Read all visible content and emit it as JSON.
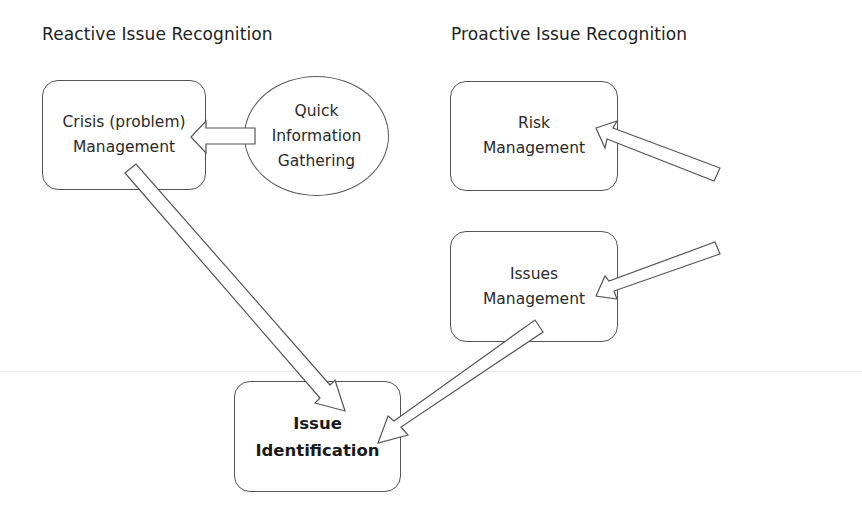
{
  "headings": {
    "reactive": "Reactive Issue Recognition",
    "proactive": "Proactive Issue Recognition"
  },
  "nodes": {
    "crisis": {
      "line1": "Crisis (problem)",
      "line2": "Management",
      "shape": "rounded-rect"
    },
    "quick": {
      "line1": "Quick",
      "line2": "Information",
      "line3": "Gathering",
      "shape": "ellipse"
    },
    "risk": {
      "line1": "Risk",
      "line2": "Management",
      "shape": "rounded-rect"
    },
    "environmental": {
      "line1": "Environmental",
      "line2": "Scanning",
      "shape": "ellipse"
    },
    "issues": {
      "line1": "Issues",
      "line2": "Management",
      "shape": "rounded-rect"
    },
    "identification": {
      "line1": "Issue",
      "line2": "Identification",
      "shape": "rounded-rect",
      "bold": true
    }
  },
  "edges": [
    {
      "from": "Quick Information Gathering",
      "to": "Crisis (problem) Management"
    },
    {
      "from": "Crisis (problem) Management",
      "to": "Issue Identification"
    },
    {
      "from": "Environmental Scanning",
      "to": "Risk Management"
    },
    {
      "from": "Environmental Scanning",
      "to": "Issues Management"
    },
    {
      "from": "Issues Management",
      "to": "Issue Identification"
    }
  ],
  "colors": {
    "stroke": "#555555",
    "text": "#2a2a2a",
    "background": "#ffffff"
  }
}
